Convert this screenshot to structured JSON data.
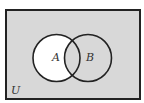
{
  "diagram": {
    "type": "venn",
    "universe_label": "U",
    "sets": [
      {
        "id": "A",
        "label": "A",
        "shaded": false
      },
      {
        "id": "B",
        "label": "B",
        "shaded": true
      }
    ],
    "shaded_region_description": "complement of A minus intersection; (A only) is unshaded",
    "colors": {
      "shaded_fill": "#d8d8d8",
      "unshaded_fill": "#ffffff",
      "stroke": "#222222"
    }
  }
}
